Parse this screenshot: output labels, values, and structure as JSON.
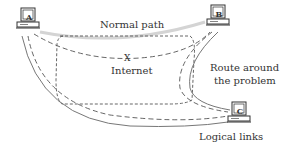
{
  "diagram": {
    "nodes": [
      {
        "id": "A",
        "label": "A"
      },
      {
        "id": "B",
        "label": "B"
      },
      {
        "id": "C",
        "label": "C"
      }
    ],
    "labels": {
      "normal_path": "Normal path",
      "internet": "Internet",
      "route_line1": "Route around",
      "route_line2": "the problem",
      "logical_links": "Logical links"
    },
    "break_mark": "X",
    "colors": {
      "line": "#555555",
      "normal_path": "#cfcfcf",
      "text": "#333333"
    }
  }
}
